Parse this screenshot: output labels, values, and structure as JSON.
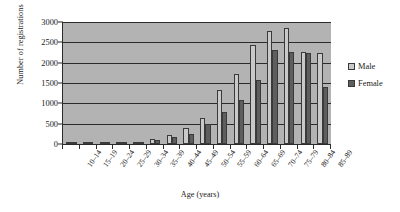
{
  "chart_data": {
    "type": "bar",
    "title": "",
    "xlabel": "Age (years)",
    "ylabel": "Number of registrations",
    "ylim": [
      0,
      3000
    ],
    "yticks": [
      0,
      500,
      1000,
      1500,
      2000,
      2500,
      3000
    ],
    "grid": true,
    "legend_position": "right",
    "categories": [
      "10–14",
      "15–19",
      "20–24",
      "25–29",
      "30–34",
      "35–39",
      "40–44",
      "45–49",
      "50–54",
      "55–59",
      "60–64",
      "65–69",
      "70–74",
      "75–79",
      "80–84",
      "85–89"
    ],
    "series": [
      {
        "name": "Male",
        "color": "#c9c9c9",
        "values": [
          5,
          10,
          20,
          30,
          60,
          130,
          220,
          390,
          640,
          1320,
          1730,
          2440,
          2790,
          2850,
          2260,
          2240
        ]
      },
      {
        "name": "Female",
        "color": "#5e5e5e",
        "values": [
          5,
          8,
          15,
          25,
          50,
          90,
          180,
          250,
          480,
          790,
          1080,
          1580,
          2300,
          2260,
          2250,
          1400
        ]
      }
    ]
  },
  "legend": {
    "items": [
      {
        "label": "Male",
        "key": "male"
      },
      {
        "label": "Female",
        "key": "female"
      }
    ]
  }
}
